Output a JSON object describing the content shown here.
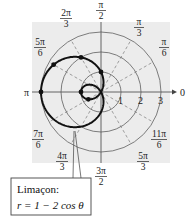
{
  "figure": {
    "type": "polar-graph",
    "curve": {
      "name": "Limaçon",
      "equation": "r = 1 − 2 cos θ",
      "label_line1": "Limaçon:",
      "label_line2": "r = 1 − 2 cos θ"
    },
    "rings": [
      1,
      2,
      3
    ],
    "ring_labels": [
      "1",
      "2",
      "3"
    ],
    "angle_labels": {
      "a0": "0",
      "a_pi6": {
        "num": "π",
        "den": "6"
      },
      "a_pi3": {
        "num": "π",
        "den": "3"
      },
      "a_pi2": {
        "num": "π",
        "den": "2"
      },
      "a_2pi3": {
        "num": "2π",
        "den": "3"
      },
      "a_5pi6": {
        "num": "5π",
        "den": "6"
      },
      "a_pi": "π",
      "a_7pi6": {
        "num": "7π",
        "den": "6"
      },
      "a_4pi3": {
        "num": "4π",
        "den": "3"
      },
      "a_3pi2": {
        "num": "3π",
        "den": "2"
      },
      "a_5pi3": {
        "num": "5π",
        "den": "3"
      },
      "a_11pi6": {
        "num": "11π",
        "den": "6"
      }
    },
    "plotted_points": [
      {
        "theta": "0",
        "r": -1
      },
      {
        "theta": "π/6",
        "r": -0.732
      },
      {
        "theta": "π/2",
        "r": 1
      },
      {
        "theta": "2π/3",
        "r": 2
      },
      {
        "theta": "5π/6",
        "r": 2.732
      },
      {
        "theta": "π",
        "r": 3
      }
    ],
    "colors": {
      "background_panel": "#ececec",
      "grid": "#6e6e6e",
      "curve": "#111111"
    }
  }
}
